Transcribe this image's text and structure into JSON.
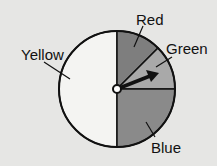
{
  "diagram": {
    "type": "spinner",
    "center": [
      117,
      89
    ],
    "radius": 58,
    "sections": [
      {
        "name": "Red",
        "label": "Red",
        "start_deg": 0,
        "end_deg": 45,
        "fill": "#7e7e7e"
      },
      {
        "name": "Green",
        "label": "Green",
        "start_deg": 45,
        "end_deg": 90,
        "fill": "#a9a9a9"
      },
      {
        "name": "Blue",
        "label": "Blue",
        "start_deg": 90,
        "end_deg": 180,
        "fill": "#8a8a8a"
      },
      {
        "name": "Yellow",
        "label": "Yellow",
        "start_deg": 180,
        "end_deg": 360,
        "fill": "#f4f4f2"
      }
    ],
    "arrow_points_to": "Green"
  },
  "labels": {
    "red": "Red",
    "green": "Green",
    "blue": "Blue",
    "yellow": "Yellow"
  },
  "colors": {
    "background": "#e6e6e4",
    "outline": "#111111"
  }
}
